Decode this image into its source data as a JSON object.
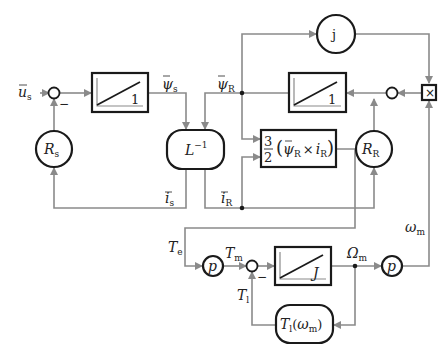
{
  "diagram": {
    "type": "block-diagram",
    "title": "",
    "blocks": {
      "integrator_stator": {
        "gain": "1"
      },
      "integrator_rotor": {
        "gain": "1"
      },
      "integrator_mech": {
        "gain": "J"
      },
      "inverse_inductance": {
        "label": "L",
        "sup": "−1"
      },
      "stator_resistance": {
        "label": "R",
        "sub": "s"
      },
      "rotor_resistance": {
        "label": "R",
        "sub": "R"
      },
      "imag_unit": {
        "label": "j"
      },
      "multiplier": {
        "label": "×"
      },
      "torque": {
        "num": "3",
        "den": "2",
        "expr_a": "ψ",
        "expr_a_sub": "R",
        "cross": "×",
        "expr_b": "i",
        "expr_b_sub": "R"
      },
      "pole_pairs_1": {
        "label": "p"
      },
      "pole_pairs_2": {
        "label": "p"
      },
      "load_torque": {
        "label": "T",
        "label_sub": "l",
        "arg": "ω",
        "arg_sub": "m"
      }
    },
    "signals": {
      "us": {
        "name": "u",
        "sub": "s"
      },
      "psi_s": {
        "name": "ψ",
        "sub": "s"
      },
      "psi_r": {
        "name": "ψ",
        "sub": "R"
      },
      "is": {
        "name": "i",
        "sub": "s"
      },
      "ir": {
        "name": "i",
        "sub": "R"
      },
      "te": {
        "name": "T",
        "sub": "e"
      },
      "tm": {
        "name": "T",
        "sub": "m"
      },
      "tl": {
        "name": "T",
        "sub": "l"
      },
      "omega_m_mech": {
        "name": "Ω",
        "sub": "m"
      },
      "omega_m": {
        "name": "ω",
        "sub": "m"
      }
    },
    "signs": {
      "minus": "−"
    }
  }
}
